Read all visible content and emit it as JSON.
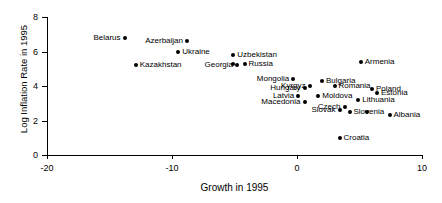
{
  "chart_data": {
    "type": "scatter",
    "title": "",
    "xlabel": "Growth in 1995",
    "ylabel": "Log Inflation Rate in 1995",
    "xlim": [
      -20,
      10
    ],
    "ylim": [
      0,
      8
    ],
    "xticks": [
      "-20",
      "-10",
      "0",
      "10"
    ],
    "yticks": [
      "0",
      "2",
      "4",
      "6",
      "8"
    ],
    "grid": false,
    "legend": "none",
    "marker": "filled-diamond",
    "marker_color": "#000000",
    "points": [
      {
        "label": "Belarus",
        "x": -13.8,
        "y": 6.8,
        "pos": "left"
      },
      {
        "label": "Azerbaijan",
        "x": -8.8,
        "y": 6.6,
        "pos": "left"
      },
      {
        "label": "Ukraine",
        "x": -9.5,
        "y": 6.0,
        "pos": "right"
      },
      {
        "label": "Uzbekistan",
        "x": -5.1,
        "y": 5.8,
        "pos": "right"
      },
      {
        "label": "Kazakhstan",
        "x": -12.9,
        "y": 5.2,
        "pos": "right"
      },
      {
        "label": "Georgia",
        "x": -4.8,
        "y": 5.2,
        "pos": "left"
      },
      {
        "label": "Russia",
        "x": -4.2,
        "y": 5.3,
        "pos": "right"
      },
      {
        "label": "",
        "x": -5.1,
        "y": 5.3,
        "pos": "right"
      },
      {
        "label": "Armenia",
        "x": 5.1,
        "y": 5.4,
        "pos": "right"
      },
      {
        "label": "Mongolia",
        "x": -0.3,
        "y": 4.4,
        "pos": "left"
      },
      {
        "label": "Bulgaria",
        "x": 2.0,
        "y": 4.3,
        "pos": "right"
      },
      {
        "label": "Kyrgyz",
        "x": 1.0,
        "y": 4.0,
        "pos": "left"
      },
      {
        "label": "Romania",
        "x": 3.0,
        "y": 4.0,
        "pos": "right"
      },
      {
        "label": "Hungary",
        "x": 0.6,
        "y": 3.9,
        "pos": "left"
      },
      {
        "label": "Poland",
        "x": 6.0,
        "y": 3.8,
        "pos": "right"
      },
      {
        "label": "Estonia",
        "x": 6.4,
        "y": 3.6,
        "pos": "right"
      },
      {
        "label": "Moldova",
        "x": 1.7,
        "y": 3.4,
        "pos": "right"
      },
      {
        "label": "Latvia",
        "x": 0.1,
        "y": 3.4,
        "pos": "left"
      },
      {
        "label": "Lithuania",
        "x": 4.9,
        "y": 3.2,
        "pos": "right"
      },
      {
        "label": "Macedonia",
        "x": 0.6,
        "y": 3.1,
        "pos": "left"
      },
      {
        "label": "Czech",
        "x": 3.8,
        "y": 2.8,
        "pos": "left"
      },
      {
        "label": "Slovak",
        "x": 3.4,
        "y": 2.6,
        "pos": "left"
      },
      {
        "label": "Slovenia",
        "x": 4.2,
        "y": 2.5,
        "pos": "right"
      },
      {
        "label": "",
        "x": 5.6,
        "y": 2.5,
        "pos": "right"
      },
      {
        "label": "Albania",
        "x": 7.4,
        "y": 2.3,
        "pos": "right"
      },
      {
        "label": "Croatia",
        "x": 3.4,
        "y": 1.0,
        "pos": "right"
      }
    ]
  }
}
